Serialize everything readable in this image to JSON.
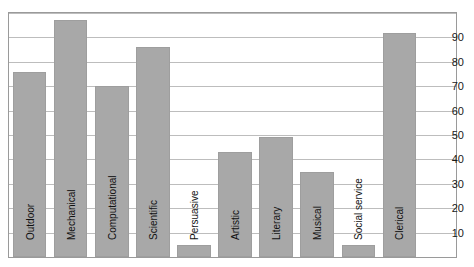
{
  "chart_data": {
    "type": "bar",
    "title": "",
    "subtitle": "",
    "xlabel": "",
    "ylabel": "",
    "categories": [
      "Outdoor",
      "Mechanical",
      "Computational",
      "Scientific",
      "Persuasive",
      "Artistic",
      "Literary",
      "Musical",
      "Social service",
      "Clerical"
    ],
    "values": [
      76,
      97,
      70,
      86,
      5,
      43,
      49,
      35,
      5,
      92
    ],
    "ylim": [
      0,
      100
    ],
    "yticks": [
      10,
      20,
      30,
      40,
      50,
      60,
      70,
      80,
      90
    ],
    "ytick_labels": [
      "10",
      "20",
      "30",
      "40",
      "50",
      "60",
      "70",
      "80",
      "90"
    ],
    "grid": true,
    "grid_axis": "y",
    "legend": "none",
    "bar_color": "#a8a8a8",
    "bar_edge_color": "#9e9e9e",
    "grid_color": "#bdbdbd",
    "axis_color": "#9a9a9a",
    "text_color": "#111111",
    "background": "#ffffff",
    "label_orientation": "vertical",
    "label_position": "inside-bottom",
    "ytick_position": "right"
  }
}
